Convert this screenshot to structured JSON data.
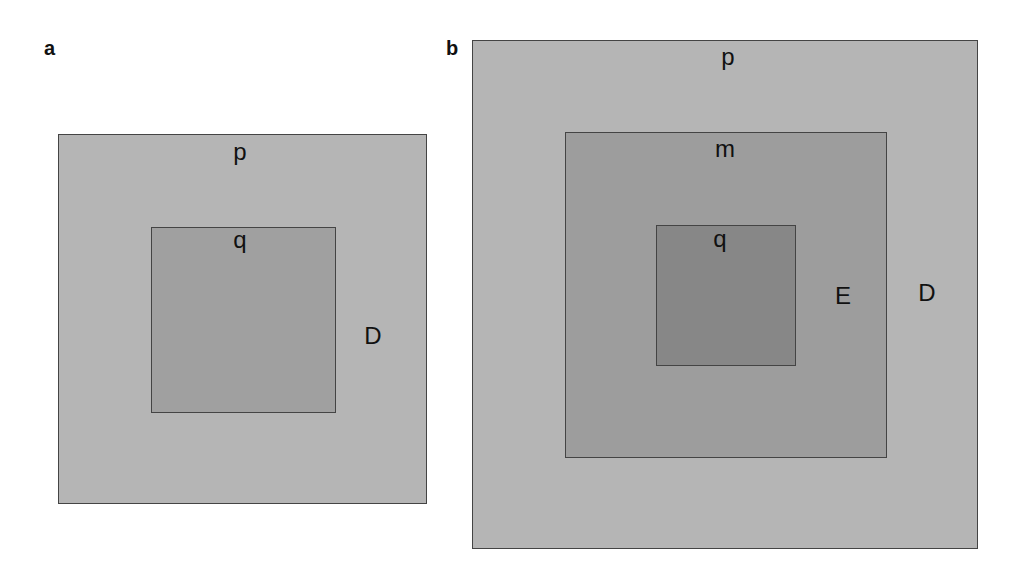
{
  "panels": [
    {
      "id": "a",
      "label": "a",
      "regions": [
        {
          "name": "D",
          "fill": "#b5b5b5",
          "top_label": "p",
          "side_label": "D"
        },
        {
          "name": "q",
          "fill": "#a0a0a0",
          "top_label": "q"
        }
      ]
    },
    {
      "id": "b",
      "label": "b",
      "regions": [
        {
          "name": "D",
          "fill": "#b5b5b5",
          "top_label": "p",
          "side_label": "D"
        },
        {
          "name": "E",
          "fill": "#9d9d9d",
          "top_label": "m",
          "side_label": "E"
        },
        {
          "name": "q",
          "fill": "#878787",
          "top_label": "q"
        }
      ]
    }
  ]
}
